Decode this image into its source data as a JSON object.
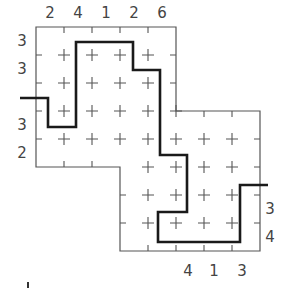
{
  "puzzle": {
    "top_clues": [
      "2",
      "4",
      "1",
      "2",
      "6"
    ],
    "left_clues_upper": [
      "3",
      "3"
    ],
    "left_clues_lower": [
      "3",
      "2"
    ],
    "right_clues": [
      "3",
      "4"
    ],
    "bottom_clues": [
      "4",
      "1",
      "3"
    ]
  },
  "colors": {
    "grid": "#555555",
    "path": "#1a1a1a",
    "clue": "#444444"
  }
}
